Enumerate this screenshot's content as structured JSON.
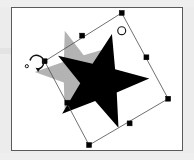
{
  "app": {
    "name": "vector-graphics-editor",
    "view": "canvas",
    "operation": "rotate-selection"
  },
  "canvas": {
    "background_color": "#ffffff",
    "border_color": "#5a5a5a",
    "outer_background_color": "#ececed",
    "frame": {
      "x": 11,
      "y": 7,
      "width": 172,
      "height": 144
    }
  },
  "shapes": [
    {
      "id": "ghost-star",
      "name": "star-ghost-preview",
      "type": "star",
      "points": 5,
      "fill": "#b3b3b3",
      "opacity": 1,
      "center_x": 78,
      "center_y": 72,
      "outer_radius": 44,
      "inner_radius": 18,
      "rotation_deg": -18,
      "role": "original-position-preview"
    },
    {
      "id": "main-star",
      "name": "star-shape",
      "type": "star",
      "points": 5,
      "fill": "#000000",
      "opacity": 1,
      "center_x": 100,
      "center_y": 82,
      "outer_radius": 50,
      "inner_radius": 20,
      "rotation_deg": 14,
      "role": "selected-object"
    }
  ],
  "selection": {
    "name": "rotated-bounding-box",
    "stroke_color": "#4a4a4a",
    "stroke_width": 0.8,
    "rotation_deg": 37,
    "corners": [
      {
        "label": "top",
        "x": 122,
        "y": 12
      },
      {
        "label": "right",
        "x": 169,
        "y": 99
      },
      {
        "label": "bottom",
        "x": 89,
        "y": 146
      },
      {
        "label": "left",
        "x": 44,
        "y": 61
      }
    ],
    "handles": [
      {
        "name": "handle-corner-top",
        "x": 122,
        "y": 12,
        "kind": "corner"
      },
      {
        "name": "handle-edge-top-right",
        "x": 147,
        "y": 57,
        "kind": "edge"
      },
      {
        "name": "handle-corner-right",
        "x": 169,
        "y": 99,
        "kind": "corner"
      },
      {
        "name": "handle-edge-bottom-right",
        "x": 130,
        "y": 124,
        "kind": "edge"
      },
      {
        "name": "handle-corner-bottom",
        "x": 89,
        "y": 146,
        "kind": "corner"
      },
      {
        "name": "handle-edge-bottom-left",
        "x": 67,
        "y": 103,
        "kind": "edge"
      },
      {
        "name": "handle-corner-left",
        "x": 44,
        "y": 61,
        "kind": "corner"
      },
      {
        "name": "handle-edge-top-left",
        "x": 82,
        "y": 35,
        "kind": "edge"
      }
    ],
    "handle_size": 5,
    "handle_fill": "#000000",
    "handle_stroke": "#000000"
  },
  "pivot": {
    "name": "rotation-pivot-marker",
    "x": 122,
    "y": 30,
    "radius": 4,
    "fill": "none",
    "stroke": "#1a1a1a",
    "stroke_width": 1.2
  },
  "cursor": {
    "name": "rotate-cursor",
    "type": "rotate",
    "x": 36,
    "y": 62,
    "hotspot_dot_x": 26,
    "hotspot_dot_y": 66,
    "stroke": "#111111",
    "arc_radius": 7
  }
}
